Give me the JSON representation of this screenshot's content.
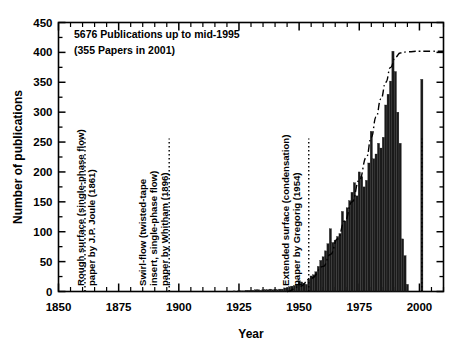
{
  "chart_data": {
    "type": "bar",
    "title": "",
    "xlabel": "Year",
    "ylabel": "Number of publications",
    "xlim": [
      1850,
      2010
    ],
    "ylim": [
      0,
      450
    ],
    "ytick_step": 50,
    "xtick_step": 25,
    "grid": false,
    "legend": "none",
    "xticks": [
      "1850",
      "1875",
      "1900",
      "1925",
      "1950",
      "1975",
      "2000"
    ],
    "yticks": [
      "0",
      "50",
      "100",
      "150",
      "200",
      "250",
      "300",
      "350",
      "400",
      "450"
    ],
    "x": [
      1850,
      1851,
      1852,
      1853,
      1854,
      1855,
      1856,
      1857,
      1858,
      1859,
      1860,
      1861,
      1862,
      1863,
      1864,
      1865,
      1866,
      1867,
      1868,
      1869,
      1870,
      1871,
      1872,
      1873,
      1874,
      1875,
      1876,
      1877,
      1878,
      1879,
      1880,
      1881,
      1882,
      1883,
      1884,
      1885,
      1886,
      1887,
      1888,
      1889,
      1890,
      1891,
      1892,
      1893,
      1894,
      1895,
      1896,
      1897,
      1898,
      1899,
      1900,
      1901,
      1902,
      1903,
      1904,
      1905,
      1906,
      1907,
      1908,
      1909,
      1910,
      1911,
      1912,
      1913,
      1914,
      1915,
      1916,
      1917,
      1918,
      1919,
      1920,
      1921,
      1922,
      1923,
      1924,
      1925,
      1926,
      1927,
      1928,
      1929,
      1930,
      1931,
      1932,
      1933,
      1934,
      1935,
      1936,
      1937,
      1938,
      1939,
      1940,
      1941,
      1942,
      1943,
      1944,
      1945,
      1946,
      1947,
      1948,
      1949,
      1950,
      1951,
      1952,
      1953,
      1954,
      1955,
      1956,
      1957,
      1958,
      1959,
      1960,
      1961,
      1962,
      1963,
      1964,
      1965,
      1966,
      1967,
      1968,
      1969,
      1970,
      1971,
      1972,
      1973,
      1974,
      1975,
      1976,
      1977,
      1978,
      1979,
      1980,
      1981,
      1982,
      1983,
      1984,
      1985,
      1986,
      1987,
      1988,
      1989,
      1990,
      1991,
      1992,
      1993,
      1994,
      1995,
      2001
    ],
    "values": [
      0,
      0,
      0,
      0,
      0,
      0,
      0,
      0,
      0,
      0,
      0,
      1,
      0,
      0,
      0,
      0,
      0,
      0,
      0,
      0,
      0,
      0,
      0,
      0,
      0,
      0,
      0,
      0,
      0,
      0,
      0,
      0,
      0,
      0,
      0,
      0,
      0,
      0,
      0,
      0,
      0,
      0,
      0,
      0,
      0,
      0,
      1,
      0,
      0,
      0,
      0,
      0,
      0,
      0,
      0,
      0,
      0,
      0,
      0,
      0,
      0,
      0,
      0,
      0,
      0,
      0,
      0,
      0,
      0,
      0,
      0,
      0,
      0,
      1,
      0,
      2,
      1,
      1,
      2,
      2,
      2,
      2,
      3,
      3,
      2,
      3,
      3,
      3,
      4,
      3,
      4,
      3,
      4,
      4,
      6,
      6,
      8,
      9,
      10,
      12,
      18,
      16,
      14,
      12,
      20,
      26,
      28,
      33,
      42,
      52,
      58,
      68,
      80,
      105,
      82,
      86,
      92,
      97,
      134,
      118,
      140,
      152,
      166,
      182,
      160,
      200,
      192,
      175,
      186,
      215,
      268,
      222,
      230,
      248,
      240,
      258,
      312,
      330,
      352,
      402,
      368,
      300,
      248,
      88,
      60,
      12,
      355
    ],
    "bar_color": "#1a1a1a",
    "trend_curve": {
      "style": "dash-dot",
      "description": "cumulative-growth trend curve rising to a plateau near 400",
      "points": [
        [
          1945,
          0
        ],
        [
          1950,
          8
        ],
        [
          1955,
          22
        ],
        [
          1960,
          42
        ],
        [
          1963,
          62
        ],
        [
          1966,
          88
        ],
        [
          1969,
          118
        ],
        [
          1972,
          150
        ],
        [
          1975,
          186
        ],
        [
          1978,
          225
        ],
        [
          1980,
          258
        ],
        [
          1982,
          292
        ],
        [
          1984,
          322
        ],
        [
          1986,
          350
        ],
        [
          1988,
          375
        ],
        [
          1990,
          392
        ],
        [
          1992,
          399
        ],
        [
          1995,
          401
        ],
        [
          2000,
          402
        ],
        [
          2005,
          402
        ],
        [
          2010,
          402
        ]
      ]
    },
    "event_markers": [
      {
        "year": 1861,
        "style": "dotted-vertical",
        "label_line1": "Rough surface (single-phase flow)",
        "label_line2": "paper by J.P. Joule (1861)"
      },
      {
        "year": 1896,
        "style": "dotted-vertical",
        "label_line1": "Swirl-flow (twisted-tape",
        "label_line2": "insert, single-phase flow)",
        "label_line3": "paper by Whitham (1896)"
      },
      {
        "year": 1954,
        "style": "dotted-vertical",
        "label_line1": "Extended surface (condensation)",
        "label_line2": "paper by Gregorig (1954)"
      },
      {
        "year": 2001,
        "style": "dotted-vertical",
        "label_line1": "",
        "label_line2": ""
      }
    ],
    "annotations": [
      {
        "name": "publications-total",
        "text": "5676 Publications up to mid-1995"
      },
      {
        "name": "papers-2001",
        "text": "(355 Papers in 2001)"
      }
    ]
  },
  "axes": {
    "y_title": "Number of publications",
    "x_title": "Year"
  },
  "notes": {
    "line1": "5676 Publications up to mid-1995",
    "line2": "(355 Papers in 2001)"
  },
  "marker_labels": {
    "joule_l1": "Rough surface (single-phase flow)",
    "joule_l2": "paper by J.P. Joule (1861)",
    "whitham_l1": "Swirl-flow (twisted-tape",
    "whitham_l2": "insert, single-phase flow)",
    "whitham_l3": "paper by Whitham (1896)",
    "gregorig_l1": "Extended surface (condensation)",
    "gregorig_l2": "paper by Gregorig (1954)"
  },
  "colors": {
    "ink": "#000000",
    "background": "#ffffff",
    "bar": "#1a1a1a"
  }
}
